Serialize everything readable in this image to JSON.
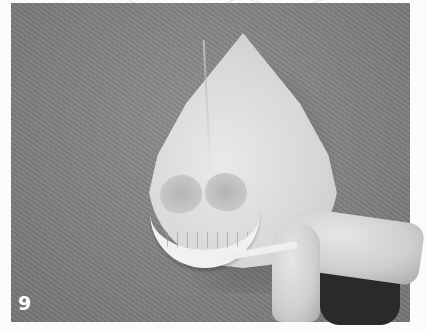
{
  "figure": {
    "step_number": "9",
    "colors": {
      "background": "#808080",
      "object": "#d9d9d9",
      "label": "#ffffff",
      "page": "#fbfbfb"
    }
  }
}
